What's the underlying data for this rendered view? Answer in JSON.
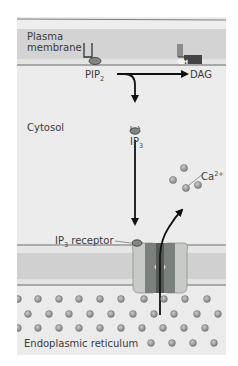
{
  "figure": {
    "regions": {
      "plasma_membrane": "Plasma membrane",
      "cytosol": "Cytosol",
      "er": "Endoplasmic reticulum"
    },
    "molecules": {
      "pip2": "PIP",
      "pip2_sub": "2",
      "dag": "DAG",
      "oh": "OH",
      "ip3": "IP",
      "ip3_sub": "3",
      "ip3_receptor": "IP",
      "ip3_receptor_sub": "3",
      "ip3_receptor_suffix": " receptor",
      "calcium": "Ca",
      "calcium_sup": "2+"
    },
    "colors": {
      "background": "#ececec",
      "membrane_band": "#d2d2d2",
      "membrane_line": "#6a6a6a",
      "channel_outer": "#c7c9c7",
      "channel_inner": "#6f7572",
      "calcium_dot": "#9a9e9b",
      "arrow": "#111111"
    }
  }
}
